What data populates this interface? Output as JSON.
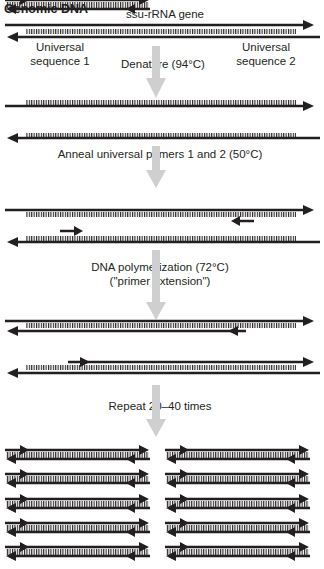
{
  "title": "Genomic DNA",
  "gene_label": "ssu-rRNA gene",
  "universal_sequence_1": [
    "Universal",
    "sequence 1"
  ],
  "universal_sequence_2": [
    "Universal",
    "sequence 2"
  ],
  "steps": [
    {
      "label": "Denature (94°C)"
    },
    {
      "label": "Anneal universal primers 1 and 2 (50°C)"
    },
    {
      "label": "DNA polymerization (72°C)",
      "sublabel": "(\"primer extension\")"
    },
    {
      "label": "Repeat 20–40 times"
    }
  ],
  "colors": {
    "strand": "#231f20",
    "process_arrow": "#cfcfcf",
    "ticks": "#231f20"
  },
  "product_grid": {
    "columns": 2,
    "rows": 5
  }
}
